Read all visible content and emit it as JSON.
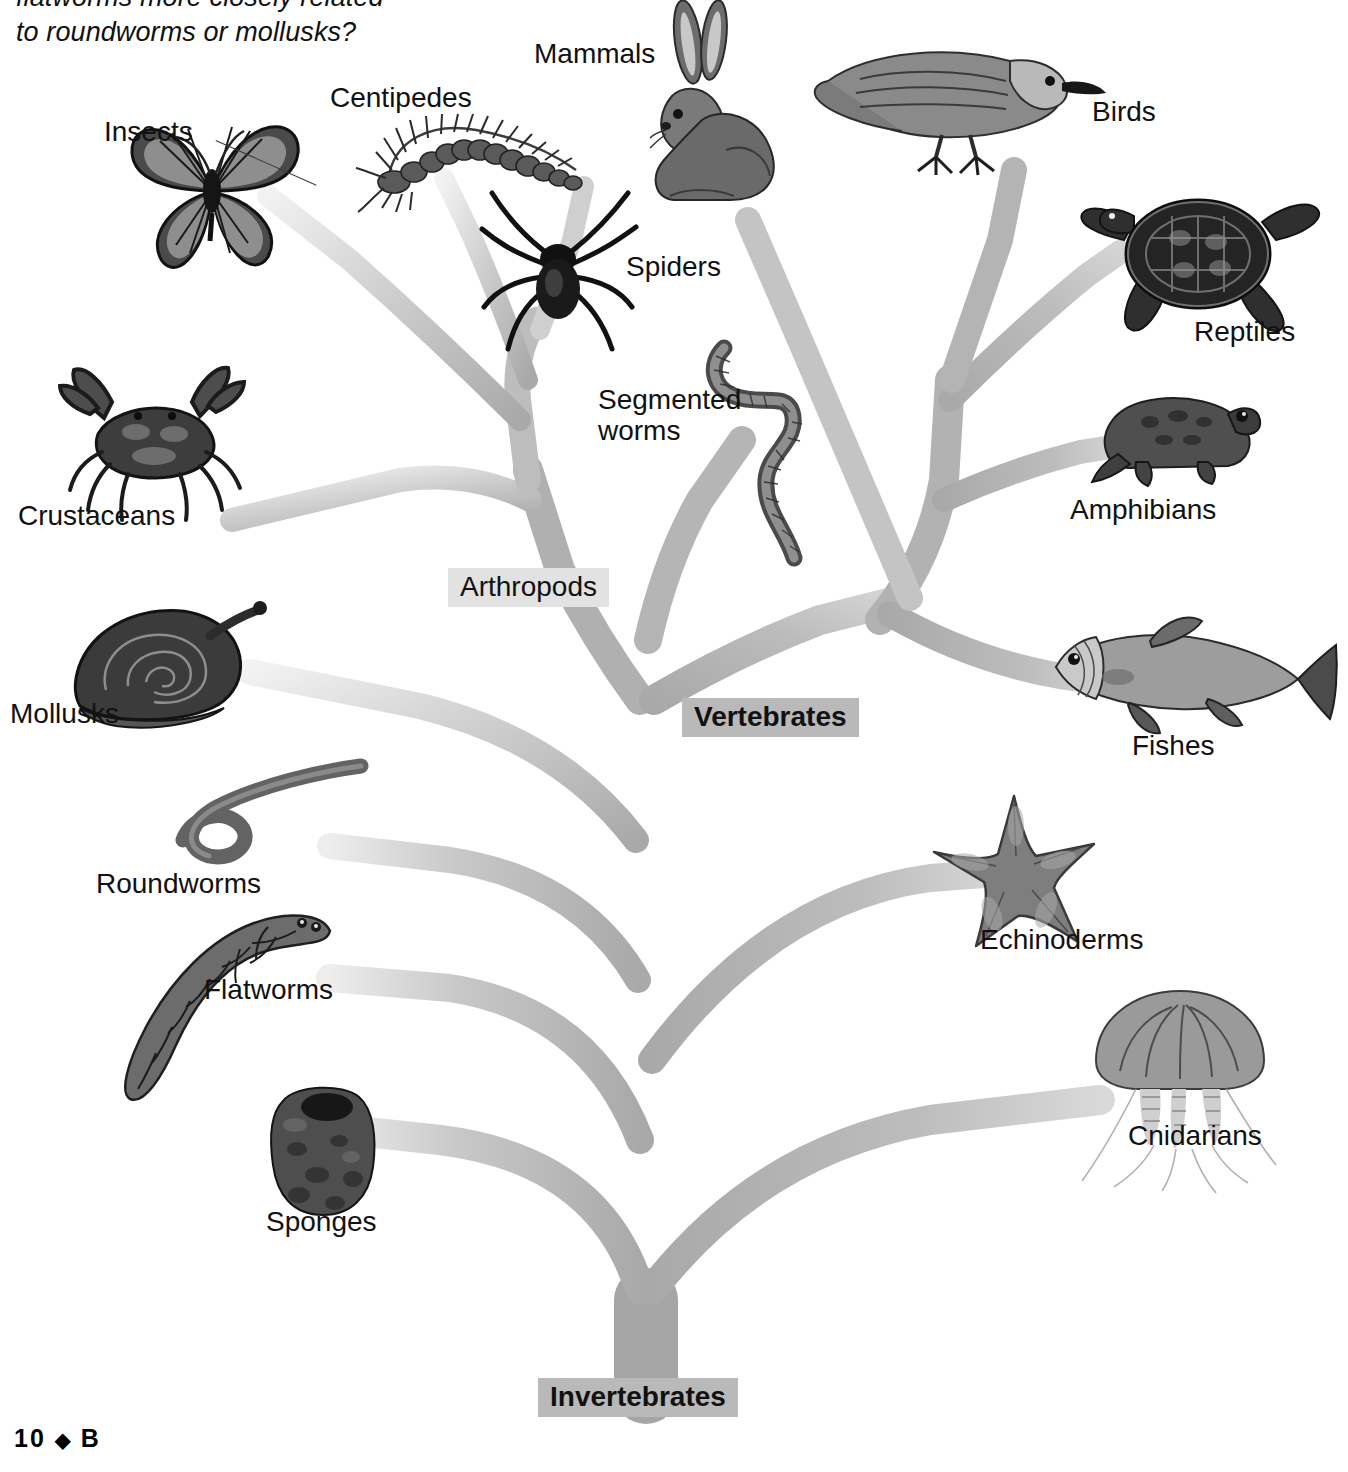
{
  "intro": {
    "question_line1": "flatworms more closely related",
    "question_line2": "to roundworms or mollusks?"
  },
  "footer": {
    "page_number": "10",
    "diamond": "◆",
    "book_letter": "B"
  },
  "diagram": {
    "colors": {
      "branch": "#a9a9a9",
      "branch_light": "#d8d8d8",
      "label_box_light": "#e2e2e2",
      "label_box_dark": "#b9b9b9",
      "text": "#111111"
    },
    "group_labels": [
      {
        "id": "arthropods",
        "text": "Arthropods",
        "style": "light"
      },
      {
        "id": "vertebrates",
        "text": "Vertebrates",
        "style": "dark"
      },
      {
        "id": "invertebrates",
        "text": "Invertebrates",
        "style": "dark"
      }
    ],
    "taxa": [
      {
        "id": "insects",
        "label": "Insects",
        "icon": "butterfly-icon"
      },
      {
        "id": "centipedes",
        "label": "Centipedes",
        "icon": "centipede-icon"
      },
      {
        "id": "mammals",
        "label": "Mammals",
        "icon": "rabbit-icon"
      },
      {
        "id": "birds",
        "label": "Birds",
        "icon": "bird-icon"
      },
      {
        "id": "spiders",
        "label": "Spiders",
        "icon": "spider-icon"
      },
      {
        "id": "reptiles",
        "label": "Reptiles",
        "icon": "turtle-icon"
      },
      {
        "id": "segmented-worms",
        "label": "Segmented worms",
        "icon": "earthworm-icon"
      },
      {
        "id": "amphibians",
        "label": "Amphibians",
        "icon": "frog-icon"
      },
      {
        "id": "crustaceans",
        "label": "Crustaceans",
        "icon": "crab-icon"
      },
      {
        "id": "mollusks",
        "label": "Mollusks",
        "icon": "snail-icon"
      },
      {
        "id": "fishes",
        "label": "Fishes",
        "icon": "fish-icon"
      },
      {
        "id": "roundworms",
        "label": "Roundworms",
        "icon": "roundworm-icon"
      },
      {
        "id": "echinoderms",
        "label": "Echinoderms",
        "icon": "starfish-icon"
      },
      {
        "id": "flatworms",
        "label": "Flatworms",
        "icon": "flatworm-icon"
      },
      {
        "id": "cnidarians",
        "label": "Cnidarians",
        "icon": "jellyfish-icon"
      },
      {
        "id": "sponges",
        "label": "Sponges",
        "icon": "sponge-icon"
      }
    ],
    "segmented_worms_lines": {
      "line1": "Segmented",
      "line2": "worms"
    }
  }
}
